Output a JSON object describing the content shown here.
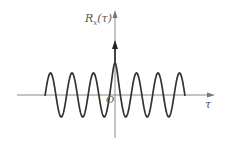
{
  "diagram": {
    "y_axis_label": "R",
    "y_axis_subscript": "x",
    "y_axis_arg": "(τ)",
    "x_axis_label": "τ",
    "origin_label": "O",
    "colors": {
      "curve": "#333333",
      "axes": "#888888",
      "impulse": "#222222"
    },
    "curve": {
      "type": "cosine",
      "x_start": 45,
      "x_end": 185,
      "center_x": 115,
      "period_px": 21.5,
      "baseline_y": 95,
      "amplitude_px": 22,
      "center_peak_y": 63
    },
    "impulse": {
      "x": 115,
      "position": "tau = 0",
      "arrow_tip_y": 41
    }
  }
}
